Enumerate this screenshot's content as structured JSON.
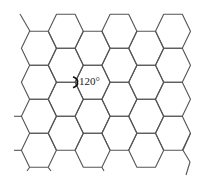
{
  "diagram": {
    "angle_label": "120°",
    "stroke_color": "#555555",
    "background": "#ffffff",
    "hex": {
      "half_width": 17.5,
      "half_edge": 9.3,
      "half_height": 17
    },
    "columns": [
      {
        "cx": 38.9,
        "cy": [
          48.3,
          82.3,
          116.3,
          150.3
        ]
      },
      {
        "cx": 65.8,
        "cy": [
          31.3,
          65.3,
          99.3,
          133.3
        ]
      },
      {
        "cx": 92.6,
        "cy": [
          48.3,
          82.3,
          116.3,
          150.3
        ]
      },
      {
        "cx": 119.4,
        "cy": [
          31.3,
          65.3,
          99.3,
          133.3
        ]
      },
      {
        "cx": 146.2,
        "cy": [
          48.3,
          82.3,
          116.3,
          150.3
        ]
      },
      {
        "cx": 173.0,
        "cy": [
          31.3,
          65.3,
          99.3,
          133.3
        ]
      }
    ],
    "stubs": [
      [
        [
          20,
          14
        ],
        [
          30,
          31.3
        ]
      ],
      [
        [
          14,
          116.3
        ],
        [
          21.4,
          116.3
        ]
      ],
      [
        [
          14,
          150.3
        ],
        [
          21.4,
          150.3
        ]
      ],
      [
        [
          29.6,
          167.3
        ],
        [
          27,
          171
        ]
      ],
      [
        [
          48.2,
          167.3
        ],
        [
          51,
          171
        ]
      ],
      [
        [
          101.9,
          167.3
        ],
        [
          104,
          171
        ]
      ],
      [
        [
          190.5,
          133.3
        ],
        [
          183,
          150.3
        ],
        [
          190,
          162
        ],
        [
          186,
          175
        ]
      ]
    ],
    "angle_marker": {
      "vertex": [
        75.1,
        82.3
      ]
    }
  }
}
